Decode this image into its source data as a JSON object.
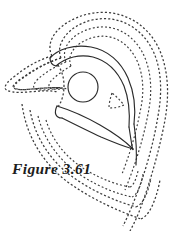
{
  "figure": {
    "caption": "Figure 3.61",
    "background_color": "#ffffff",
    "stroke_color": "#2b2b2b",
    "dashed_stroke_color": "#3a3a3a",
    "width": 187,
    "height": 231
  },
  "chart_data": {
    "type": "line",
    "title": "Figure 3.61",
    "subtitle": "",
    "xlabel": "",
    "ylabel": "",
    "grid": false,
    "legend": null,
    "xlim": [
      0,
      187
    ],
    "ylim": [
      0,
      231
    ],
    "series": [
      {
        "name": "outer-dashed-contour-1",
        "style": "dashed",
        "closed": true,
        "path": "M 61 58 C 55 44 68 26 92 20 C 119 14 143 28 154 53 C 162 72 162 94 158 116 C 153 147 143 180 132 206 C 128 216 125 222 123 226"
      },
      {
        "name": "outer-dashed-contour-2",
        "style": "dashed",
        "closed": true,
        "path": "M 52 56 C 44 40 60 21 88 14 C 120 7 148 23 160 51 C 169 73 169 97 165 120 C 159 152 149 186 139 212 C 135 222 132 227 130 231"
      },
      {
        "name": "dashed-contour-3",
        "style": "dashed",
        "closed": true,
        "path": "M 66 62 C 60 48 72 33 93 28 C 116 23 136 36 145 58 C 152 75 152 95 148 114 C 143 141 134 168 125 190"
      },
      {
        "name": "dashed-contour-4",
        "style": "dashed",
        "closed": true,
        "path": "M 71 66 C 66 54 77 41 95 37 C 114 33 130 44 138 63 C 144 78 144 95 140 112 C 136 134 129 156 122 174"
      },
      {
        "name": "left-cusp-dashed",
        "style": "dashed",
        "closed": false,
        "path": "M 61 58 C 47 62 33 70 22 78 C 16 82 13 85 13 87 C 14 90 22 90 32 89 C 44 88 55 87 62 88"
      },
      {
        "name": "inner-solid-arc-upper",
        "style": "solid",
        "closed": false,
        "path": "M 50 58 C 58 49 74 44 91 47 C 108 50 121 62 128 78 C 134 92 136 108 134 124"
      },
      {
        "name": "inner-solid-arc-lower",
        "style": "solid",
        "closed": false,
        "path": "M 56 66 C 66 57 80 54 93 57 C 108 61 118 72 124 86 C 129 99 130 113 129 127"
      },
      {
        "name": "center-circle",
        "style": "solid",
        "closed": true,
        "cx": 83,
        "cy": 87,
        "r": 15
      },
      {
        "name": "lens-solid-upper",
        "style": "solid",
        "closed": false,
        "path": "M 57 106 C 70 110 86 117 100 125 C 114 133 125 141 133 149"
      },
      {
        "name": "lens-solid-lower",
        "style": "solid",
        "closed": false,
        "path": "M 62 118 C 74 124 88 131 101 137 C 115 143 126 147 133 149"
      },
      {
        "name": "lens-solid-tail",
        "style": "solid",
        "closed": false,
        "path": "M 57 106 C 54 112 55 118 62 118"
      },
      {
        "name": "small-dashed-triangle",
        "style": "dashed",
        "closed": true,
        "path": "M 112 93 C 110 99 109 104 109 108 C 115 108 120 107 124 105 C 120 100 116 96 112 93 Z"
      },
      {
        "name": "inner-left-dashed-wedge",
        "style": "dashed",
        "closed": false,
        "path": "M 58 65 C 62 71 64 78 64 86 C 64 94 62 101 58 107"
      },
      {
        "name": "bottom-dashed-sweep-1",
        "style": "dashed",
        "closed": false,
        "path": "M 46 120 C 52 140 66 158 86 170 C 103 180 118 185 130 187"
      },
      {
        "name": "bottom-dashed-sweep-2",
        "style": "dashed",
        "closed": false,
        "path": "M 38 116 C 44 140 60 162 82 176 C 101 188 118 194 132 197"
      },
      {
        "name": "bottom-dashed-sweep-3",
        "style": "dashed",
        "closed": false,
        "path": "M 30 110 C 35 138 52 164 77 180 C 98 194 119 202 136 207"
      }
    ]
  }
}
